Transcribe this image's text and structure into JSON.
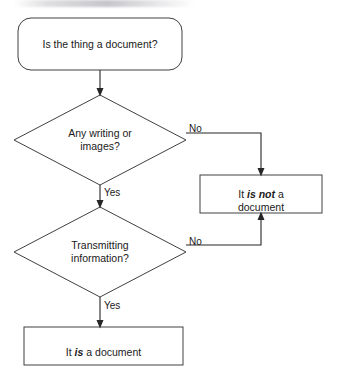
{
  "diagram": {
    "type": "flowchart",
    "title": "Is the thing a document?",
    "background_color": "#ffffff",
    "line_color": "#262626",
    "shape_stroke_color": "#404040",
    "text_color": "#1a1a1a",
    "nodes": [
      {
        "id": "start",
        "shape": "rounded-rectangle",
        "label": "Is the thing a document?",
        "x": 100,
        "y": 44,
        "width": 164,
        "height": 52
      },
      {
        "id": "decision-writing",
        "shape": "diamond",
        "label": "Any writing or\nimages?",
        "x": 100,
        "y": 140,
        "width": 172,
        "height": 90
      },
      {
        "id": "decision-transmitting",
        "shape": "diamond",
        "label": "Transmitting\ninformation?",
        "x": 100,
        "y": 252,
        "width": 172,
        "height": 90
      },
      {
        "id": "result-not-document",
        "shape": "rectangle",
        "label_prefix": "It ",
        "label_emphasis": "is not",
        "label_suffix": " a document",
        "x": 261,
        "y": 194,
        "width": 122,
        "height": 38
      },
      {
        "id": "result-is-document",
        "shape": "rectangle",
        "label_prefix": "It ",
        "label_emphasis": "is",
        "label_suffix": " a document",
        "x": 103.5,
        "y": 346,
        "width": 159,
        "height": 38
      }
    ],
    "edges": [
      {
        "id": "start-to-writing",
        "from": "start",
        "to": "decision-writing",
        "label": ""
      },
      {
        "id": "writing-no",
        "from": "decision-writing",
        "to": "result-not-document",
        "label": "No",
        "label_x": 189,
        "label_y": 123
      },
      {
        "id": "writing-yes",
        "from": "decision-writing",
        "to": "decision-transmitting",
        "label": "Yes",
        "label_x": 104,
        "label_y": 187
      },
      {
        "id": "transmitting-no",
        "from": "decision-transmitting",
        "to": "result-not-document",
        "label": "No",
        "label_x": 189,
        "label_y": 236
      },
      {
        "id": "transmitting-yes",
        "from": "decision-transmitting",
        "to": "result-is-document",
        "label": "Yes",
        "label_x": 104,
        "label_y": 300
      }
    ]
  }
}
